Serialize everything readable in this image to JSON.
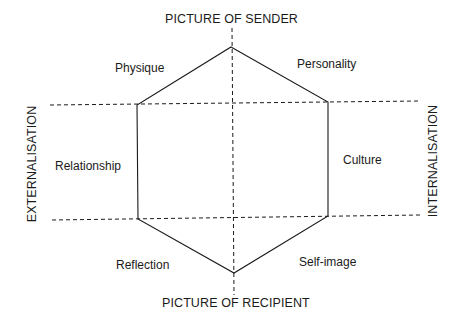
{
  "diagram": {
    "axes": {
      "top": "PICTURE OF SENDER",
      "bottom": "PICTURE OF RECIPIENT",
      "left": "EXTERNALISATION",
      "right": "INTERNALISATION"
    },
    "facets": {
      "physique": "Physique",
      "personality": "Personality",
      "relationship": "Relationship",
      "culture": "Culture",
      "reflection": "Reflection",
      "self_image": "Self-image"
    },
    "colors": {
      "line": "#1a1a1a",
      "background": "#ffffff"
    }
  }
}
